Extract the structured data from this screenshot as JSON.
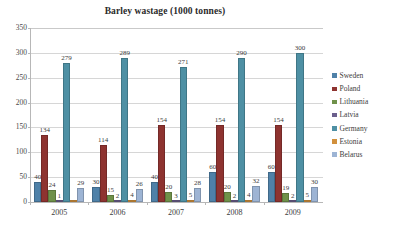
{
  "chart_data": {
    "type": "bar",
    "title": "Barley wastage (1000 tonnes)",
    "xlabel": "",
    "ylabel": "",
    "ylim": [
      0,
      350
    ],
    "yticks": [
      0,
      50,
      100,
      150,
      200,
      250,
      300,
      350
    ],
    "grid": true,
    "legend_position": "right",
    "categories": [
      "2005",
      "2006",
      "2007",
      "2008",
      "2009"
    ],
    "series": [
      {
        "name": "Sweden",
        "color": "#4f81a8",
        "values": [
          40,
          30,
          40,
          60,
          60
        ]
      },
      {
        "name": "Poland",
        "color": "#8e3330",
        "values": [
          134,
          114,
          154,
          154,
          154
        ]
      },
      {
        "name": "Lithuania",
        "color": "#6f9149",
        "values": [
          24,
          15,
          20,
          20,
          19
        ]
      },
      {
        "name": "Latvia",
        "color": "#6b5f8c",
        "values": [
          1,
          2,
          3,
          2,
          2
        ]
      },
      {
        "name": "Germany",
        "color": "#4e90a4",
        "values": [
          279,
          289,
          271,
          290,
          300
        ]
      },
      {
        "name": "Estonia",
        "color": "#d1903c",
        "values": [
          0,
          4,
          5,
          4,
          5
        ]
      },
      {
        "name": "Belarus",
        "color": "#9db4d4",
        "values": [
          29,
          26,
          28,
          32,
          30
        ]
      }
    ],
    "value_labels": {
      "2005": [
        "40",
        "134",
        "24",
        "1",
        "279",
        "",
        "29"
      ],
      "2006": [
        "30",
        "114",
        "15",
        "2",
        "289",
        "4",
        "26"
      ],
      "2007": [
        "40",
        "154",
        "20",
        "3",
        "271",
        "5",
        "28"
      ],
      "2008": [
        "60",
        "154",
        "20",
        "2",
        "290",
        "4",
        "32"
      ],
      "2009": [
        "60",
        "154",
        "19",
        "2",
        "300",
        "5",
        "30"
      ]
    }
  },
  "axis": {
    "y_tick_labels": [
      "350",
      "300",
      "250",
      "200",
      "150",
      "100",
      "50",
      "0"
    ],
    "x_tick_labels": [
      "2005",
      "2006",
      "2007",
      "2008",
      "2009"
    ]
  },
  "legend": {
    "items": [
      {
        "label": "Sweden"
      },
      {
        "label": "Poland"
      },
      {
        "label": "Lithuania"
      },
      {
        "label": "Latvia"
      },
      {
        "label": "Germany"
      },
      {
        "label": "Estonia"
      },
      {
        "label": "Belarus"
      }
    ]
  }
}
